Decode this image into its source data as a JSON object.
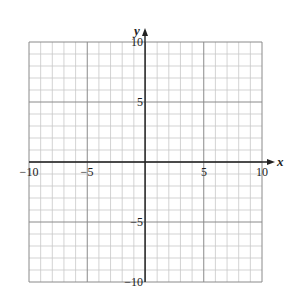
{
  "chart_data": {
    "type": "scatter",
    "title": "",
    "xlabel": "x",
    "ylabel": "y",
    "xlim": [
      -10,
      10
    ],
    "ylim": [
      -10,
      10
    ],
    "grid": true,
    "grid_step": 1,
    "major_grid_step": 5,
    "x_ticks": [
      -10,
      -5,
      5,
      10
    ],
    "y_ticks": [
      10,
      5,
      -5,
      -10
    ],
    "x_tick_labels": [
      "−10",
      "−5",
      "5",
      "10"
    ],
    "y_tick_labels": [
      "10",
      "5",
      "−5",
      "−10"
    ],
    "series": []
  },
  "colors": {
    "minor_grid": "#c8c8c8",
    "major_grid": "#8a8a8a",
    "axis": "#222222"
  }
}
